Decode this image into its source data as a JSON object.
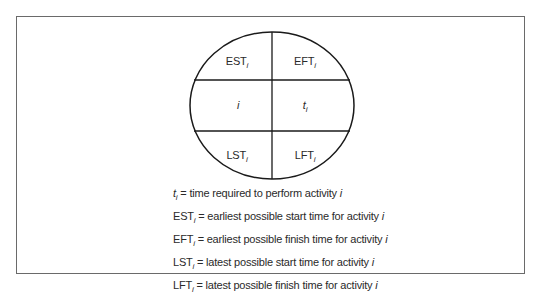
{
  "diagram": {
    "type": "activity-node",
    "node": {
      "shape": "circle",
      "cells": {
        "top_left": {
          "main": "EST",
          "sub": "i"
        },
        "top_right": {
          "main": "EFT",
          "sub": "i"
        },
        "mid_left": {
          "main": "i",
          "sub": ""
        },
        "mid_right": {
          "main": "t",
          "sub": "i"
        },
        "bottom_left": {
          "main": "LST",
          "sub": "i"
        },
        "bottom_right": {
          "main": "LFT",
          "sub": "i"
        }
      }
    },
    "legend": [
      {
        "symbol": "t",
        "sub": "i",
        "italic_symbol": true,
        "text": "= time required to perform activity ",
        "var": "i"
      },
      {
        "symbol": "EST",
        "sub": "i",
        "italic_symbol": false,
        "text": "= earliest possible start time for activity ",
        "var": "i"
      },
      {
        "symbol": "EFT",
        "sub": "i",
        "italic_symbol": false,
        "text": "= earliest possible finish time for activity ",
        "var": "i"
      },
      {
        "symbol": "LST",
        "sub": "i",
        "italic_symbol": false,
        "text": "= latest possible start time for activity ",
        "var": "i"
      },
      {
        "symbol": "LFT",
        "sub": "i",
        "italic_symbol": false,
        "text": "= latest possible finish time for activity ",
        "var": "i"
      }
    ],
    "colors": {
      "line": "#1a1a1a",
      "frame": "#6a6a6a",
      "text": "#2a2a2a"
    }
  }
}
